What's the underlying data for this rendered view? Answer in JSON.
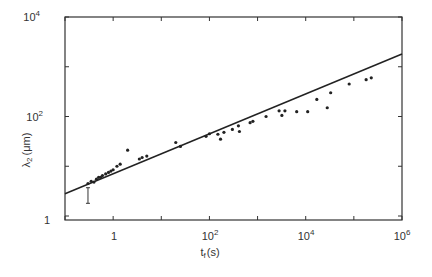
{
  "chart_data": {
    "type": "scatter",
    "title": "",
    "xlabel": "t_f (s)",
    "ylabel": "λ2 (μm)",
    "xscale": "log",
    "yscale": "log",
    "xlim": [
      0.1,
      1000000
    ],
    "ylim": [
      1,
      10000
    ],
    "grid": false,
    "legend": null,
    "x_ticks": [
      {
        "value": 1,
        "label": "1"
      },
      {
        "value": 100,
        "label": "10^2"
      },
      {
        "value": 10000,
        "label": "10^4"
      },
      {
        "value": 1000000,
        "label": "10^6"
      }
    ],
    "y_ticks": [
      {
        "value": 1,
        "label": "1"
      },
      {
        "value": 100,
        "label": "10^2"
      },
      {
        "value": 10000,
        "label": "10^4"
      }
    ],
    "series": [
      {
        "name": "measurements",
        "style": "points",
        "x": [
          0.3,
          0.35,
          0.4,
          0.45,
          0.5,
          0.55,
          0.6,
          0.7,
          0.8,
          0.9,
          1.0,
          1.2,
          1.4,
          2.0,
          3.5,
          4.0,
          5.0,
          20,
          25,
          85,
          100,
          150,
          170,
          200,
          300,
          400,
          420,
          700,
          800,
          1500,
          2800,
          3200,
          3700,
          6500,
          11000,
          17000,
          28000,
          33000,
          80000,
          180000,
          230000
        ],
        "y": [
          4.5,
          5.0,
          4.8,
          5.5,
          6.0,
          6.0,
          6.5,
          7.0,
          7.5,
          8.0,
          8.5,
          10.0,
          11.0,
          21,
          14,
          15,
          16,
          30,
          25,
          40,
          45,
          44,
          35,
          48,
          55,
          65,
          50,
          75,
          80,
          100,
          130,
          105,
          130,
          125,
          125,
          220,
          150,
          300,
          450,
          550,
          600
        ]
      },
      {
        "name": "error-bar",
        "style": "errorbar",
        "x": [
          0.3
        ],
        "y_low": [
          1.8
        ],
        "y_high": [
          3.7
        ]
      },
      {
        "name": "fit",
        "style": "line",
        "x": [
          0.1,
          1000000
        ],
        "y": [
          2.8,
          1800
        ],
        "slope_loglog": 0.4
      }
    ]
  },
  "labels": {
    "x_axis_main": "t",
    "x_axis_sub": "f",
    "x_axis_unit": "(s)",
    "y_axis_main": "λ",
    "y_axis_sub": "2",
    "y_axis_unit": "(μm)",
    "x_tick_1": "1",
    "x_tick_2_base": "10",
    "x_tick_2_exp": "2",
    "x_tick_4_base": "10",
    "x_tick_4_exp": "4",
    "x_tick_6_base": "10",
    "x_tick_6_exp": "6",
    "y_tick_0": "1",
    "y_tick_2_base": "10",
    "y_tick_2_exp": "2",
    "y_tick_4_base": "10",
    "y_tick_4_exp": "4"
  }
}
